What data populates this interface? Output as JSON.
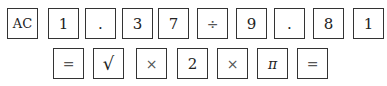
{
  "row1": [
    {
      "label": "AC",
      "x": 7
    },
    {
      "label": "1",
      "x": 48
    },
    {
      "label": ".",
      "x": 85
    },
    {
      "label": "3",
      "x": 122
    },
    {
      "label": "7",
      "x": 158
    },
    {
      "label": "÷",
      "x": 197
    },
    {
      "label": "9",
      "x": 236
    },
    {
      "label": ".",
      "x": 274
    },
    {
      "label": "8",
      "x": 313
    },
    {
      "label": "1",
      "x": 353
    }
  ],
  "row2": [
    {
      "label": "=",
      "x": 53
    },
    {
      "label": "√",
      "x": 93
    },
    {
      "label": "×",
      "x": 136
    },
    {
      "label": "2",
      "x": 177
    },
    {
      "label": "×",
      "x": 217
    },
    {
      "label": "π",
      "x": 257
    },
    {
      "label": "=",
      "x": 297
    }
  ]
}
